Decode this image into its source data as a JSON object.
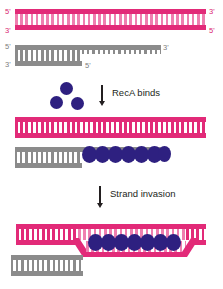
{
  "figure": {
    "width": 223,
    "height": 289,
    "background": "#ffffff"
  },
  "colors": {
    "pink": "#e22a78",
    "pink_light": "#ef7fb0",
    "gray": "#8b8b8b",
    "reca_blob": "#2e2080",
    "text": "#231f20",
    "label_pink": "#d9266f",
    "label_gray": "#7d7d7d"
  },
  "panels": [
    {
      "id": "panel-1-substrates",
      "molecules": [
        {
          "id": "recipient-duplex",
          "type": "double-stranded-dna",
          "color": "pink",
          "labels": {
            "left_top": "5'",
            "left_bottom": "3'",
            "right_top": "3'",
            "right_bottom": "5'"
          }
        },
        {
          "id": "donor-duplex-with-overhang",
          "type": "double-stranded-dna-with-3prime-overhang",
          "color": "gray",
          "labels": {
            "left_top": "5'",
            "left_bottom": "3'",
            "right_top": "3'",
            "inner_bottom": "5'"
          }
        }
      ]
    },
    {
      "id": "panel-2-reca-binds",
      "step": {
        "caption": "RecA binds",
        "arrow": "down-arrow-icon"
      },
      "free_proteins": {
        "name": "RecA",
        "count": 3
      },
      "molecules": [
        {
          "id": "recipient-duplex",
          "type": "double-stranded-dna",
          "color": "pink"
        },
        {
          "id": "reca-nucleoprotein-filament",
          "type": "ssdna-coated-by-reca",
          "color": "gray",
          "protein_count": 7
        }
      ]
    },
    {
      "id": "panel-3-strand-invasion",
      "step": {
        "caption": "Strand invasion",
        "arrow": "down-arrow-icon"
      },
      "molecules": [
        {
          "id": "d-loop",
          "type": "displacement-loop",
          "color": "pink",
          "protein_count": 7
        },
        {
          "id": "donor-duplex-remainder",
          "type": "double-stranded-dna",
          "color": "gray"
        }
      ]
    }
  ]
}
